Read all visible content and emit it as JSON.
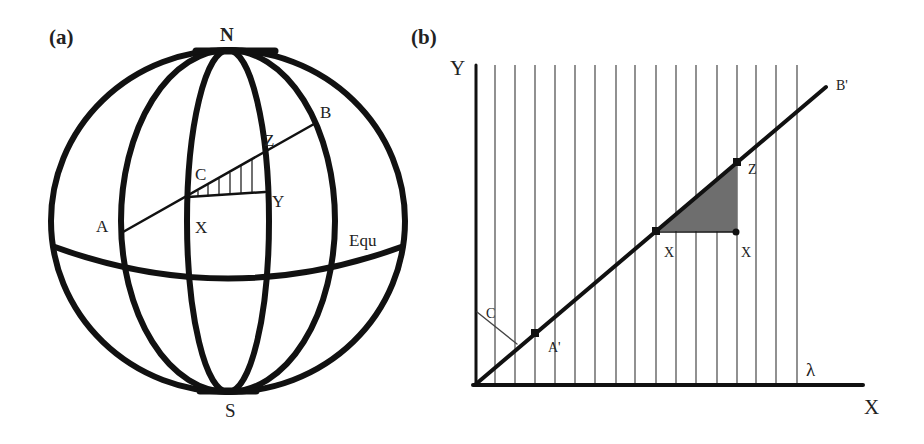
{
  "panel_a": {
    "label": "(a)",
    "north": "N",
    "south": "S",
    "point_a": "A",
    "point_b": "B",
    "point_c": "C",
    "point_x": "X",
    "point_y": "Y",
    "point_z": "Z",
    "equator": "Equ"
  },
  "panel_b": {
    "label": "(b)",
    "y_axis": "Y",
    "x_axis": "X",
    "lambda": "λ",
    "point_a_prime": "A'",
    "point_b_prime": "B'",
    "point_c": "C",
    "point_x_left": "X",
    "point_x_right": "X",
    "point_z": "Z"
  },
  "colors": {
    "line": "#111111",
    "grid": "#555555",
    "shade": "#6e6e6e"
  }
}
